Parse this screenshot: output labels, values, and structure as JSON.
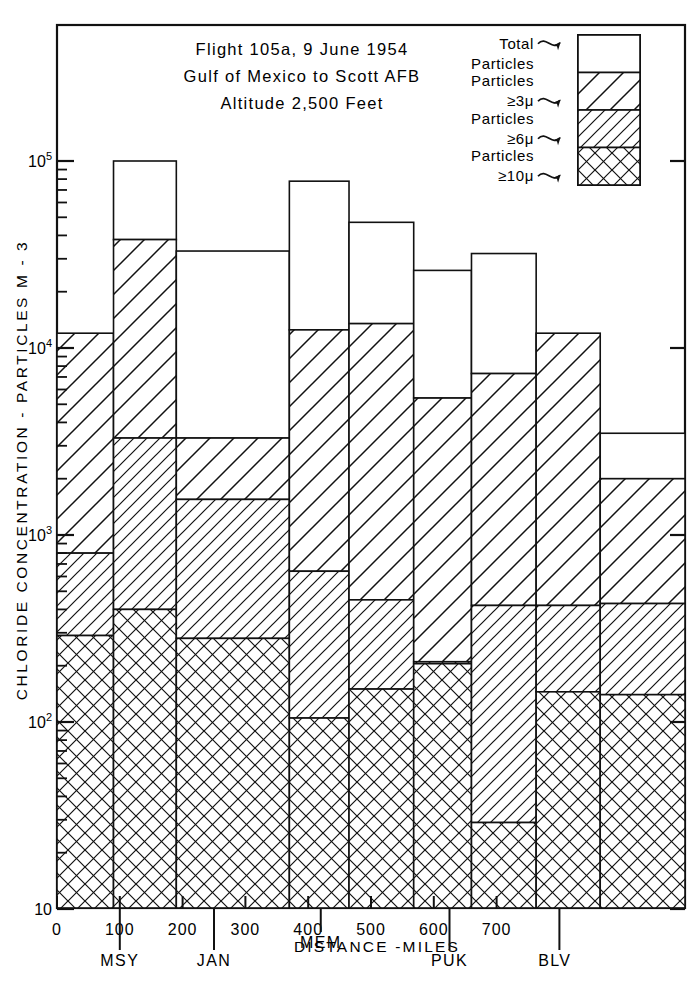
{
  "title": {
    "line1": "Flight 105a,  9 June 1954",
    "line2": "Gulf of Mexico to Scott AFB",
    "line3": "Altitude 2,500 Feet"
  },
  "legend": {
    "position": "top-right",
    "items": [
      {
        "label_line1": "Total",
        "label_line2": "Particles",
        "pattern": "blank"
      },
      {
        "label_line1": "Particles",
        "label_line2": "≥3μ",
        "pattern": "diag-wide"
      },
      {
        "label_line1": "Particles",
        "label_line2": "≥6μ",
        "pattern": "diag-narrow"
      },
      {
        "label_line1": "Particles",
        "label_line2": "≥10μ",
        "pattern": "crosshatch"
      }
    ]
  },
  "axes": {
    "ylabel": "CHLORIDE  CONCENTRATION - PARTICLES  M⁻³",
    "ylabel_parts": {
      "text": "CHLORIDE  CONCENTRATION - PARTICLES  M - 3"
    },
    "xlabel": "DISTANCE -IMILES",
    "xlabel_display": "DISTANCE -MILES",
    "ytick_labels": [
      "10",
      "10",
      "10",
      "10",
      "10"
    ],
    "ytick_exponents": [
      "5",
      "4",
      "3",
      "2",
      ""
    ],
    "ytick_values": [
      100000,
      10000,
      1000,
      100,
      10
    ],
    "ylim": [
      10,
      200000
    ],
    "xtick_labels": [
      "0",
      "100",
      "200",
      "300",
      "400",
      "500",
      "600",
      "700"
    ],
    "xtick_values": [
      0,
      100,
      200,
      300,
      400,
      500,
      600,
      700
    ],
    "xlim": [
      0,
      800
    ],
    "grid": false,
    "scale": "log"
  },
  "stations": [
    {
      "name": "MSY",
      "distance": 100
    },
    {
      "name": "JAN",
      "distance": 250
    },
    {
      "name": "MEM",
      "distance": 420
    },
    {
      "name": "PUK",
      "distance": 625
    },
    {
      "name": "BLV",
      "distance": 800
    }
  ],
  "chart_data": {
    "type": "bar",
    "xlabel": "DISTANCE - MILES",
    "ylabel": "CHLORIDE CONCENTRATION - PARTICLES M-3",
    "ylim": [
      10,
      200000
    ],
    "xlim": [
      0,
      800
    ],
    "yscale": "log",
    "grid": false,
    "legend_position": "top-right",
    "categories": [
      "0-90",
      "90-190",
      "190-370",
      "370-465",
      "465-568",
      "568-660",
      "660-763",
      "763-865",
      "865-1000"
    ],
    "bar_edges": [
      0,
      90,
      190,
      370,
      465,
      568,
      660,
      763,
      865,
      1000
    ],
    "series": [
      {
        "name": "Total Particles",
        "values": [
          12000,
          100000,
          33000,
          78000,
          47000,
          26000,
          32000,
          12000,
          3500
        ]
      },
      {
        "name": "Particles ≥3μ",
        "values": [
          12000,
          38000,
          3300,
          12500,
          13500,
          5400,
          7300,
          12000,
          2000
        ]
      },
      {
        "name": "Particles ≥6μ",
        "values": [
          800,
          3300,
          1550,
          640,
          450,
          210,
          420,
          420,
          430
        ]
      },
      {
        "name": "Particles ≥10μ",
        "values": [
          290,
          400,
          280,
          105,
          150,
          205,
          29,
          145,
          140
        ]
      }
    ]
  },
  "bars": [
    {
      "x0": 0,
      "x1": 90,
      "total": 12000,
      "p3": 12000,
      "p6": 800,
      "p10": 290
    },
    {
      "x0": 90,
      "x1": 190,
      "total": 100000,
      "p3": 38000,
      "p6": 3300,
      "p10": 400
    },
    {
      "x0": 190,
      "x1": 370,
      "total": 33000,
      "p3": 3300,
      "p6": 1550,
      "p10": 280
    },
    {
      "x0": 370,
      "x1": 465,
      "total": 78000,
      "p3": 12500,
      "p6": 640,
      "p10": 105
    },
    {
      "x0": 465,
      "x1": 568,
      "total": 47000,
      "p3": 13500,
      "p6": 450,
      "p10": 150
    },
    {
      "x0": 568,
      "x1": 660,
      "total": 26000,
      "p3": 5400,
      "p6": 210,
      "p10": 205
    },
    {
      "x0": 660,
      "x1": 763,
      "total": 32000,
      "p3": 7300,
      "p6": 420,
      "p10": 29
    },
    {
      "x0": 763,
      "x1": 865,
      "total": 12000,
      "p3": 12000,
      "p6": 420,
      "p10": 145
    },
    {
      "x0": 865,
      "x1": 1000,
      "total": 3500,
      "p3": 2000,
      "p6": 430,
      "p10": 140
    }
  ],
  "colors": {
    "ink": "#111111",
    "paper": "#ffffff"
  }
}
